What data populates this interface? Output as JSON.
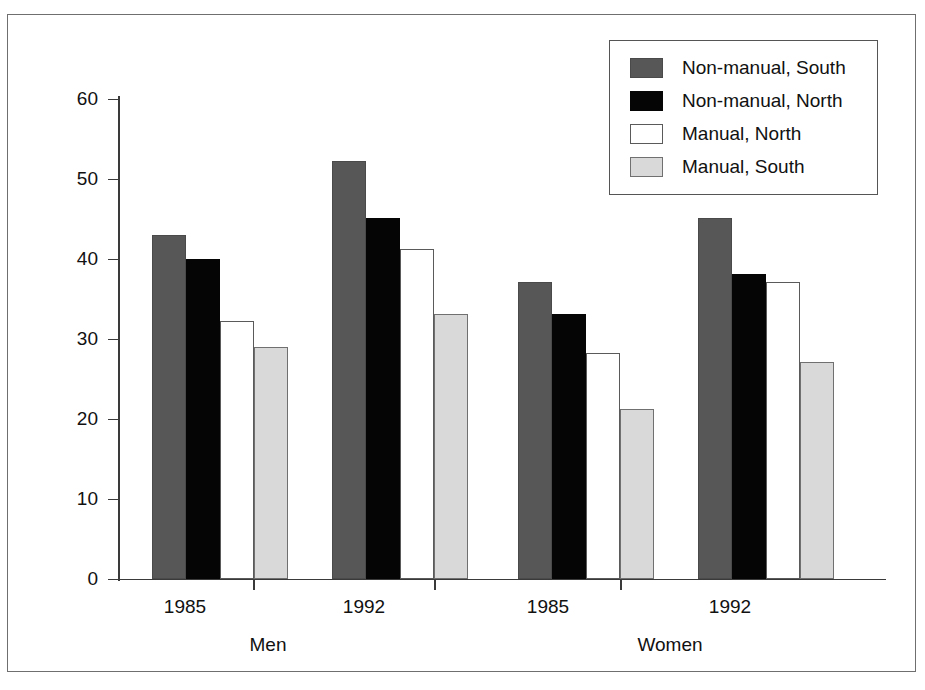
{
  "chart_data": {
    "type": "bar",
    "title": "",
    "subtitle": "",
    "xlabel": "",
    "ylabel": "% adults",
    "ylim": [
      0,
      60
    ],
    "yticks": [
      0,
      10,
      20,
      30,
      40,
      50,
      60
    ],
    "ytick_labels": [
      "0",
      "10",
      "20",
      "30",
      "40",
      "50",
      "60"
    ],
    "grid": false,
    "legend_position": "top-right",
    "categories": [
      "1985",
      "1992",
      "1985",
      "1992"
    ],
    "group_labels": [
      "Men",
      "Women"
    ],
    "groups": [
      {
        "sex": "Men",
        "years": [
          {
            "year": "1985",
            "values": [
              43.0,
              40.0,
              32.2,
              29.0
            ]
          },
          {
            "year": "1992",
            "values": [
              52.3,
              45.1,
              41.2,
              33.1
            ]
          }
        ]
      },
      {
        "sex": "Women",
        "years": [
          {
            "year": "1985",
            "values": [
              37.1,
              33.1,
              28.2,
              21.2
            ]
          },
          {
            "year": "1992",
            "values": [
              45.1,
              38.1,
              37.1,
              27.1
            ]
          }
        ]
      }
    ],
    "series": [
      {
        "name": "Non-manual, South",
        "color": "#575757",
        "values": [
          43.0,
          52.3,
          37.1,
          45.1
        ]
      },
      {
        "name": "Non-manual, North",
        "color": "#050505",
        "values": [
          40.0,
          45.1,
          33.1,
          38.1
        ]
      },
      {
        "name": "Manual, North",
        "color": "#ffffff",
        "values": [
          32.2,
          41.2,
          28.2,
          37.1
        ]
      },
      {
        "name": "Manual, South",
        "color": "#d9d9d9",
        "values": [
          29.0,
          33.1,
          21.2,
          27.1
        ]
      }
    ]
  },
  "legend": {
    "items": [
      {
        "label": "Non-manual, South",
        "swatch": "dark-gray-swatch"
      },
      {
        "label": "Non-manual, North",
        "swatch": "black-swatch"
      },
      {
        "label": "Manual, North",
        "swatch": "white-swatch"
      },
      {
        "label": "Manual, South",
        "swatch": "light-gray-swatch"
      }
    ]
  },
  "axes": {
    "y_label": "% adults",
    "y_ticks": [
      "60",
      "50",
      "40",
      "30",
      "20",
      "10",
      "0"
    ],
    "x_year_labels": [
      "1985",
      "1992",
      "1985",
      "1992"
    ],
    "x_group_labels": [
      "Men",
      "Women"
    ]
  }
}
